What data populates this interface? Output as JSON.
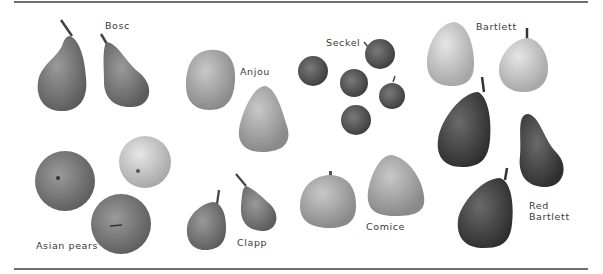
{
  "figure": {
    "labels": {
      "bosc": "Bosc",
      "anjou": "Anjou",
      "seckel": "Seckel",
      "bartlett": "Bartlett",
      "asian": "Asian pears",
      "clapp": "Clapp",
      "comice": "Comice",
      "red_bartlett_1": "Red",
      "red_bartlett_2": "Bartlett"
    },
    "colors": {
      "rule": "#6e6e6e",
      "label": "#3a3a3a",
      "background": "#ffffff"
    }
  }
}
